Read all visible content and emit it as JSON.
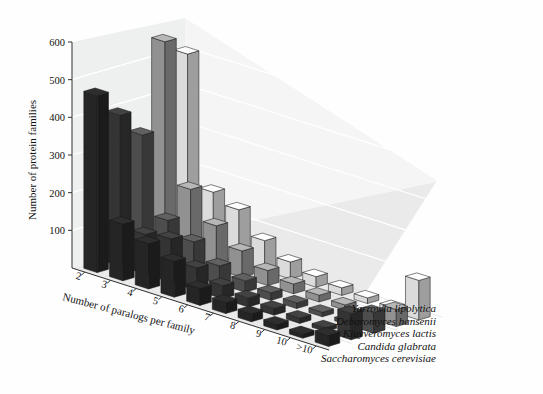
{
  "chart_data": {
    "type": "bar",
    "style": "3d-grouped-bar",
    "title": "",
    "xlabel": "Number of paralogs per family",
    "ylabel": "Number of protein families",
    "zlabel": "",
    "categories": [
      "2",
      "3",
      "4",
      "5",
      "6",
      "7",
      "8",
      "9",
      "10",
      ">10"
    ],
    "ylim": [
      0,
      600
    ],
    "yticks": [
      100,
      200,
      300,
      400,
      500,
      600
    ],
    "grid": true,
    "legend_position": "right-bottom",
    "series": [
      {
        "name": "Saccharomyces cerevisiae",
        "color": "#2b2b2b",
        "values": [
          470,
          150,
          120,
          95,
          45,
          30,
          22,
          16,
          12,
          30
        ]
      },
      {
        "name": "Candida glabrata",
        "color": "#3d3d3d",
        "values": [
          400,
          105,
          115,
          60,
          35,
          24,
          18,
          14,
          10,
          70
        ]
      },
      {
        "name": "Kluyveromyces lactis",
        "color": "#5a5a5a",
        "values": [
          330,
          125,
          90,
          48,
          30,
          20,
          15,
          12,
          9,
          55
        ]
      },
      {
        "name": "Debaromyces hansenii",
        "color": "#a9a9a9",
        "values": [
          560,
          190,
          115,
          70,
          40,
          26,
          18,
          14,
          10,
          45
        ]
      },
      {
        "name": "Yarrowia lipolytica",
        "color": "#ffffff",
        "values": [
          510,
          165,
          140,
          80,
          45,
          28,
          20,
          15,
          11,
          105
        ]
      }
    ]
  },
  "axes": {
    "y_tick_labels": [
      "600",
      "500",
      "400",
      "300",
      "200",
      "100"
    ],
    "x_tick_labels": [
      "2",
      "3",
      "4",
      "5",
      "6",
      "7",
      "8",
      "9",
      "10",
      ">10"
    ],
    "y_axis_title": "Number of protein families",
    "x_axis_title": "Number of paralogs per family"
  },
  "legend": {
    "items": [
      {
        "label": "Yarrowia lipolytica"
      },
      {
        "label": "Debaromyces hansenii"
      },
      {
        "label": "Kluyveromyces lactis"
      },
      {
        "label": "Candida glabrata"
      },
      {
        "label": "Saccharomyces cerevisiae"
      }
    ]
  },
  "colors": {
    "floor": "#ececec",
    "wall": "#f2f2f2",
    "gridline": "#ffffff",
    "axis": "#333333"
  }
}
